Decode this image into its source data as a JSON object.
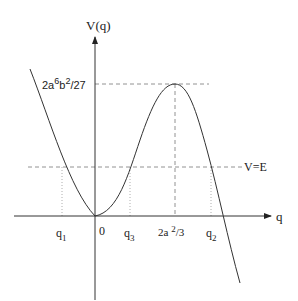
{
  "diagram": {
    "y_axis_label": "V(q)",
    "x_axis_label": "q",
    "peak_value_label": {
      "base": "2a",
      "sup1": "6",
      "mid": "b",
      "sup2": "2",
      "tail": "/27"
    },
    "energy_line_label": "V=E",
    "x_ticks": [
      {
        "name": "q1",
        "base": "q",
        "sub": "1"
      },
      {
        "name": "origin",
        "base": "0",
        "sub": ""
      },
      {
        "name": "q3",
        "base": "q",
        "sub": "3"
      },
      {
        "name": "peak-position",
        "base": "2a ",
        "sup": "2",
        "tail": "/3"
      },
      {
        "name": "q2",
        "base": "q",
        "sub": "2"
      }
    ],
    "colors": {
      "curve": "#333333",
      "axis": "#333333",
      "dashed": "#777777"
    }
  }
}
